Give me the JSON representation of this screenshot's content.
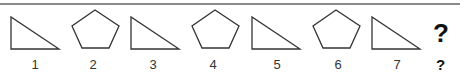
{
  "sequence": {
    "items": [
      {
        "index": "1",
        "shape": "right-triangle"
      },
      {
        "index": "2",
        "shape": "pentagon"
      },
      {
        "index": "3",
        "shape": "right-triangle"
      },
      {
        "index": "4",
        "shape": "pentagon"
      },
      {
        "index": "5",
        "shape": "right-triangle"
      },
      {
        "index": "6",
        "shape": "pentagon"
      },
      {
        "index": "7",
        "shape": "right-triangle"
      }
    ],
    "unknown_shape": "?",
    "unknown_label": "?"
  },
  "colors": {
    "stroke": "#333333",
    "rule": "#8a8a8a"
  }
}
